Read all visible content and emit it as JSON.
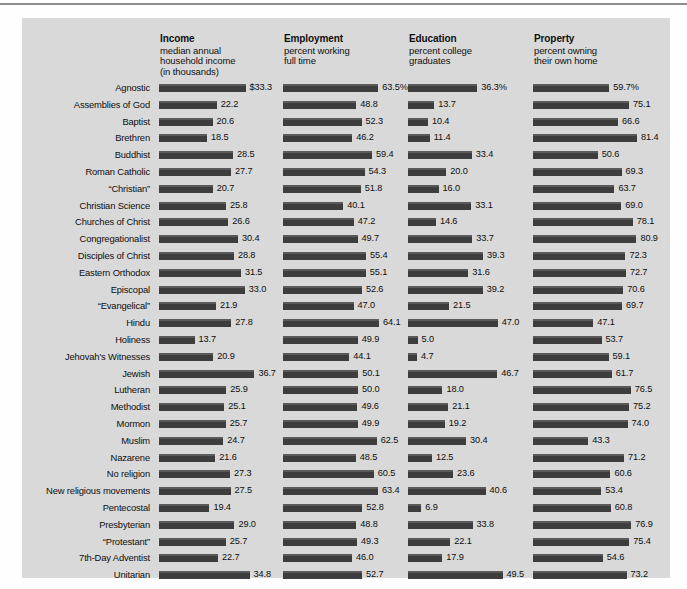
{
  "chart_data": {
    "type": "bar",
    "title": "",
    "grid": false,
    "legend": "none",
    "orientation": "horizontal",
    "panels": [
      {
        "key": "income",
        "title": "Income",
        "subtitle": [
          "median annual",
          "household income",
          "(in thousands)"
        ],
        "unit": "thousands of dollars",
        "axis_max": 40,
        "xlabel": "",
        "ylabel": ""
      },
      {
        "key": "employment",
        "title": "Employment",
        "subtitle": [
          "percent working",
          "full time"
        ],
        "unit": "percent",
        "axis_max": 70,
        "xlabel": "",
        "ylabel": ""
      },
      {
        "key": "education",
        "title": "Education",
        "subtitle": [
          "percent college",
          "graduates"
        ],
        "unit": "percent",
        "axis_max": 55,
        "xlabel": "",
        "ylabel": ""
      },
      {
        "key": "property",
        "title": "Property",
        "subtitle": [
          "percent owning",
          "their own home"
        ],
        "unit": "percent",
        "axis_max": 90,
        "xlabel": "",
        "ylabel": ""
      }
    ],
    "categories": [
      "Agnostic",
      "Assemblies of God",
      "Baptist",
      "Brethren",
      "Buddhist",
      "Roman Catholic",
      "“Christian”",
      "Christian Science",
      "Churches of Christ",
      "Congregationalist",
      "Disciples of Christ",
      "Eastern Orthodox",
      "Episcopal",
      "“Evangelical”",
      "Hindu",
      "Holiness",
      "Jehovah’s Witnesses",
      "Jewish",
      "Lutheran",
      "Methodist",
      "Mormon",
      "Muslim",
      "Nazarene",
      "No religion",
      "New religious movements",
      "Pentecostal",
      "Presbyterian",
      "“Protestant”",
      "7th-Day Adventist",
      "Unitarian"
    ],
    "series": [
      {
        "name": "Income",
        "values": [
          33.3,
          22.2,
          20.6,
          18.5,
          28.5,
          27.7,
          20.7,
          25.8,
          26.6,
          30.4,
          28.8,
          31.5,
          33.0,
          21.9,
          27.8,
          13.7,
          20.9,
          36.7,
          25.9,
          25.1,
          25.7,
          24.7,
          21.6,
          27.3,
          27.5,
          19.4,
          29.0,
          25.7,
          22.7,
          34.8
        ],
        "labels": [
          "$33.3",
          "22.2",
          "20.6",
          "18.5",
          "28.5",
          "27.7",
          "20.7",
          "25.8",
          "26.6",
          "30.4",
          "28.8",
          "31.5",
          "33.0",
          "21.9",
          "27.8",
          "13.7",
          "20.9",
          "36.7",
          "25.9",
          "25.1",
          "25.7",
          "24.7",
          "21.6",
          "27.3",
          "27.5",
          "19.4",
          "29.0",
          "25.7",
          "22.7",
          "34.8"
        ]
      },
      {
        "name": "Employment",
        "values": [
          63.5,
          48.8,
          52.3,
          46.2,
          59.4,
          54.3,
          51.8,
          40.1,
          47.2,
          49.7,
          55.4,
          55.1,
          52.6,
          47.0,
          64.1,
          49.9,
          44.1,
          50.1,
          50.0,
          49.6,
          49.9,
          62.5,
          48.5,
          60.5,
          63.4,
          52.8,
          48.8,
          49.3,
          46.0,
          52.7
        ],
        "labels": [
          "63.5%",
          "48.8",
          "52.3",
          "46.2",
          "59.4",
          "54.3",
          "51.8",
          "40.1",
          "47.2",
          "49.7",
          "55.4",
          "55.1",
          "52.6",
          "47.0",
          "64.1",
          "49.9",
          "44.1",
          "50.1",
          "50.0",
          "49.6",
          "49.9",
          "62.5",
          "48.5",
          "60.5",
          "63.4",
          "52.8",
          "48.8",
          "49.3",
          "46.0",
          "52.7"
        ]
      },
      {
        "name": "Education",
        "values": [
          36.3,
          13.7,
          10.4,
          11.4,
          33.4,
          20.0,
          16.0,
          33.1,
          14.6,
          33.7,
          39.3,
          31.6,
          39.2,
          21.5,
          47.0,
          5.0,
          4.7,
          46.7,
          18.0,
          21.1,
          19.2,
          30.4,
          12.5,
          23.6,
          40.6,
          6.9,
          33.8,
          22.1,
          17.9,
          49.5
        ],
        "labels": [
          "36.3%",
          "13.7",
          "10.4",
          "11.4",
          "33.4",
          "20.0",
          "16.0",
          "33.1",
          "14.6",
          "33.7",
          "39.3",
          "31.6",
          "39.2",
          "21.5",
          "47.0",
          "5.0",
          "4.7",
          "46.7",
          "18.0",
          "21.1",
          "19.2",
          "30.4",
          "12.5",
          "23.6",
          "40.6",
          "6.9",
          "33.8",
          "22.1",
          "17.9",
          "49.5"
        ]
      },
      {
        "name": "Property",
        "values": [
          59.7,
          75.1,
          66.6,
          81.4,
          50.6,
          69.3,
          63.7,
          69.0,
          78.1,
          80.9,
          72.3,
          72.7,
          70.6,
          69.7,
          47.1,
          53.7,
          59.1,
          61.7,
          76.5,
          75.2,
          74.0,
          43.3,
          71.2,
          60.6,
          53.4,
          60.8,
          76.9,
          75.4,
          54.6,
          73.2
        ],
        "labels": [
          "59.7%",
          "75.1",
          "66.6",
          "81.4",
          "50.6",
          "69.3",
          "63.7",
          "69.0",
          "78.1",
          "80.9",
          "72.3",
          "72.7",
          "70.6",
          "69.7",
          "47.1",
          "53.7",
          "59.1",
          "61.7",
          "76.5",
          "75.2",
          "74.0",
          "43.3",
          "71.2",
          "60.6",
          "53.4",
          "60.8",
          "76.9",
          "75.4",
          "54.6",
          "73.2"
        ]
      }
    ]
  },
  "colors": {
    "panel_background": "#d9d9d9",
    "bar_fill": "#3d3d3d",
    "bar_highlight": "#5a5a5a",
    "text": "#0e0e0e",
    "rule": "#8d8d8d"
  }
}
